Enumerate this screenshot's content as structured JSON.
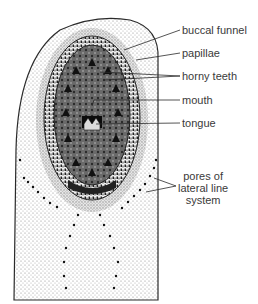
{
  "figure": {
    "labels": [
      {
        "id": "buccal-funnel",
        "text": "buccal funnel",
        "x": 182,
        "y": 24
      },
      {
        "id": "papillae",
        "text": "papillae",
        "x": 182,
        "y": 47
      },
      {
        "id": "horny-teeth",
        "text": "horny teeth",
        "x": 182,
        "y": 70
      },
      {
        "id": "mouth",
        "text": "mouth",
        "x": 182,
        "y": 94
      },
      {
        "id": "tongue",
        "text": "tongue",
        "x": 182,
        "y": 117
      },
      {
        "id": "pores-of-lateral-line-system",
        "lines": [
          "pores of",
          "lateral line",
          "system"
        ],
        "x": 178,
        "y": 170
      }
    ],
    "colors": {
      "ink": "#2a2a2a",
      "stipple": "#9a9a9a",
      "background": "#ffffff",
      "label_text": "#3a3a3a"
    }
  }
}
